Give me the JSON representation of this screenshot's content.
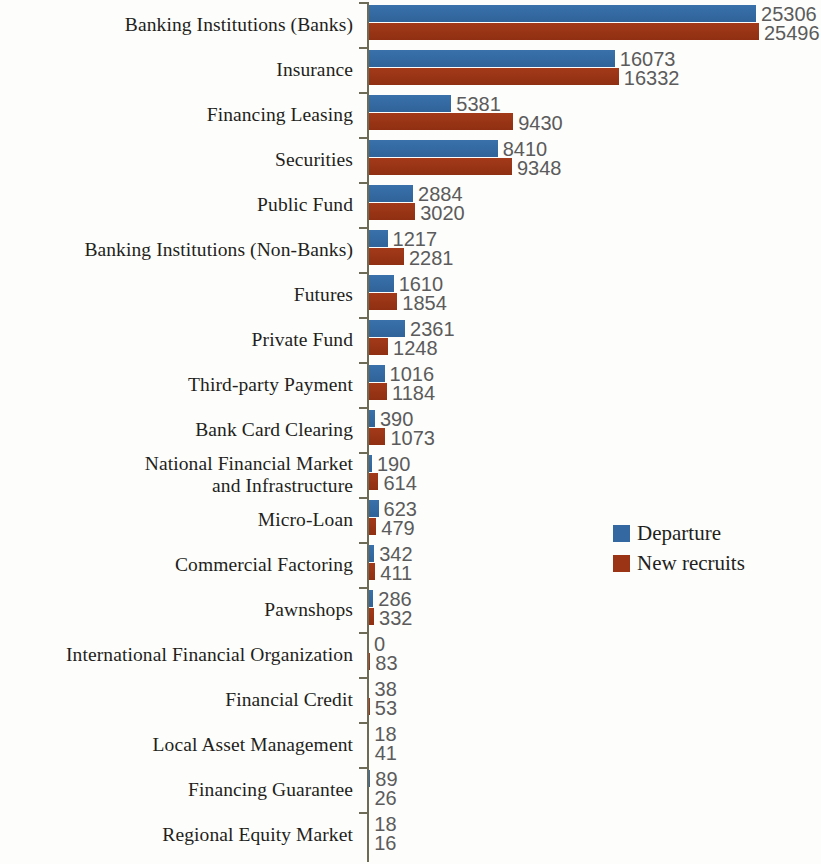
{
  "chart_data": {
    "type": "bar",
    "orientation": "horizontal",
    "title": "",
    "subtitle": "",
    "xlabel": "",
    "ylabel": "",
    "grid": false,
    "legend_position": "middle-right",
    "xlim": [
      0,
      25496
    ],
    "categories": [
      "Banking Institutions (Banks)",
      "Insurance",
      "Financing Leasing",
      "Securities",
      "Public Fund",
      "Banking Institutions (Non-Banks)",
      "Futures",
      "Private Fund",
      "Third-party Payment",
      "Bank Card Clearing",
      "National Financial Market\nand Infrastructure",
      "Micro-Loan",
      "Commercial Factoring",
      "Pawnshops",
      "International Financial Organization",
      "Financial Credit",
      "Local Asset Management",
      "Financing Guarantee",
      "Regional Equity Market"
    ],
    "series": [
      {
        "name": "Departure",
        "color": "#3468a0",
        "values": [
          25306,
          16073,
          5381,
          8410,
          2884,
          1217,
          1610,
          2361,
          1016,
          390,
          190,
          623,
          342,
          286,
          0,
          38,
          18,
          89,
          18
        ]
      },
      {
        "name": "New recruits",
        "color": "#9a3415",
        "values": [
          25496,
          16332,
          9430,
          9348,
          3020,
          2281,
          1854,
          1248,
          1184,
          1073,
          614,
          479,
          411,
          332,
          83,
          53,
          41,
          26,
          16
        ]
      }
    ]
  },
  "legend": {
    "items": [
      {
        "label": "Departure",
        "color": "#3468a0"
      },
      {
        "label": "New recruits",
        "color": "#9a3415"
      }
    ]
  },
  "colors": {
    "departure": "#3468a0",
    "new_recruits": "#9a3415",
    "axis": "#6d6a55",
    "category_text": "#231f1c",
    "value_text": "#5b5b5b",
    "background": "#fdfdfb"
  }
}
